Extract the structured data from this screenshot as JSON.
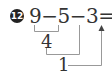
{
  "problem": {
    "number": "12",
    "equation": "9−5−3=1",
    "operands": [
      "9",
      "5",
      "3"
    ],
    "result": "1"
  },
  "steps": [
    {
      "expression": "9−5",
      "value": "4"
    },
    {
      "expression": "4−3",
      "value": "1"
    }
  ],
  "colors": {
    "text": "#333333",
    "lines": "#999999",
    "badge": "#222222"
  }
}
